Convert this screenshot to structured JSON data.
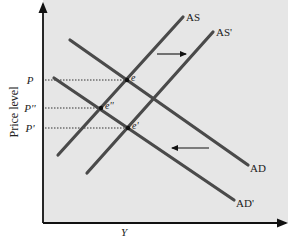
{
  "diagram": {
    "type": "AS-AD shift",
    "y_axis_label": "Price level",
    "x_axis_label": "Y",
    "price_labels": [
      {
        "label": "P",
        "y": 80
      },
      {
        "label": "P''",
        "y": 108
      },
      {
        "label": "P'",
        "y": 128
      }
    ],
    "curves": [
      {
        "name": "AS",
        "label": "AS",
        "from": [
          58,
          155
        ],
        "to": [
          183,
          17
        ],
        "label_pos": [
          186,
          21
        ]
      },
      {
        "name": "AS-prime",
        "label": "AS'",
        "from": [
          87,
          173
        ],
        "to": [
          213,
          32
        ],
        "label_pos": [
          216,
          36
        ]
      },
      {
        "name": "AD",
        "label": "AD",
        "from": [
          70,
          40
        ],
        "to": [
          248,
          165
        ],
        "label_pos": [
          250,
          172
        ]
      },
      {
        "name": "AD-prime",
        "label": "AD'",
        "from": [
          54,
          78
        ],
        "to": [
          234,
          200
        ],
        "label_pos": [
          236,
          207
        ]
      }
    ],
    "equilibria": [
      {
        "name": "e",
        "label": "e",
        "point": [
          127,
          80
        ]
      },
      {
        "name": "e-double-prime",
        "label": "e''",
        "point": [
          101,
          108
        ]
      },
      {
        "name": "e-prime",
        "label": "e'",
        "point": [
          128,
          128
        ]
      }
    ],
    "shift_arrows": [
      {
        "name": "as-shift-right",
        "direction": "right",
        "from": [
          157,
          54
        ],
        "to": [
          186,
          54
        ]
      },
      {
        "name": "ad-shift-left",
        "direction": "left",
        "from": [
          209,
          148
        ],
        "to": [
          172,
          148
        ]
      }
    ],
    "colors": {
      "panel": "#e6e6e6",
      "curve": "#4a4a4a",
      "axis": "#111111",
      "text": "#222222"
    }
  }
}
